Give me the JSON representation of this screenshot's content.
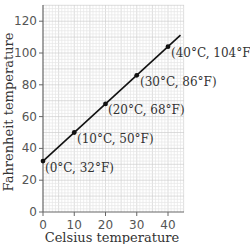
{
  "chart_data": {
    "type": "line",
    "title": "",
    "xlabel": "Celsius temperature",
    "ylabel": "Fahrenheit temperature",
    "xlim": [
      0,
      45
    ],
    "ylim": [
      0,
      130
    ],
    "x_ticks": [
      0,
      10,
      20,
      30,
      40
    ],
    "y_ticks": [
      0,
      20,
      40,
      60,
      80,
      100,
      120
    ],
    "grid": true,
    "legend": null,
    "series": [
      {
        "name": "F = 1.8C + 32",
        "x": [
          0,
          10,
          20,
          30,
          40
        ],
        "y": [
          32,
          50,
          68,
          86,
          104
        ]
      }
    ],
    "annotations": [
      "(0°C, 32°F)",
      "(10°C, 50°F)",
      "(20°C, 68°F)",
      "(30°C, 86°F)",
      "(40°C, 104°F)"
    ]
  },
  "axes": {
    "x_title": "Celsius temperature",
    "y_title": "Fahrenheit temperature",
    "x_tick_labels": [
      "0",
      "10",
      "20",
      "30",
      "40"
    ],
    "y_tick_labels": [
      "0",
      "20",
      "40",
      "60",
      "80",
      "100",
      "120"
    ]
  },
  "points": [
    {
      "label": "(0°C, 32°F)"
    },
    {
      "label": "(10°C, 50°F)"
    },
    {
      "label": "(20°C, 68°F)"
    },
    {
      "label": "(30°C, 86°F)"
    },
    {
      "label": "(40°C, 104°F)"
    }
  ],
  "colors": {
    "grid_minor": "#e6e6e6",
    "grid_major": "#cfcfcf",
    "axis": "#666666",
    "line": "#111111"
  }
}
